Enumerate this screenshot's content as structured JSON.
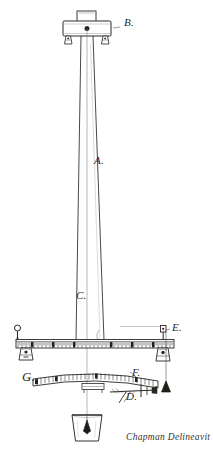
{
  "drawing": {
    "title": "Mast and graduated beam apparatus",
    "medium": "pen and ink line drawing",
    "background_color": "#ffffff",
    "ink_color": "#2a2724",
    "signature": "Chapman Delineavit",
    "labels": [
      {
        "key": "B",
        "text": "B.",
        "refers_to": "top-bracket-block",
        "x": 124,
        "y": 22
      },
      {
        "key": "A",
        "text": "A.",
        "refers_to": "tapered-mast",
        "x": 94,
        "y": 160
      },
      {
        "key": "C",
        "text": "C.",
        "refers_to": "mast-lower-section",
        "x": 76,
        "y": 295
      },
      {
        "key": "E",
        "text": "E.",
        "refers_to": "pulley-and-weight",
        "x": 172,
        "y": 327
      },
      {
        "key": "F",
        "text": "F.",
        "refers_to": "curved-scale-arm",
        "x": 132,
        "y": 372
      },
      {
        "key": "G",
        "text": "G.",
        "refers_to": "curved-arm-left-end",
        "x": 22,
        "y": 375
      },
      {
        "key": "D",
        "text": "D.",
        "refers_to": "clamp-and-cross-screw",
        "x": 128,
        "y": 393
      }
    ],
    "parts": [
      {
        "name": "top-bracket-block",
        "label": "B",
        "description": "rectangular cap block with raised centre boss, pivot point and two small feet"
      },
      {
        "name": "tapered-mast",
        "label": "A",
        "description": "long tapered vertical mast narrowing toward the top"
      },
      {
        "name": "plumb-line",
        "label": "",
        "description": "fine vertical thread dropped from the pivot at B to the vessel below"
      },
      {
        "name": "graduated-beam",
        "label": "",
        "description": "horizontal ruler graduated with fine tick marks across its full length"
      },
      {
        "name": "beam-left-fitting",
        "label": "",
        "description": "ring eye and bracket clamp at left end of the graduated beam"
      },
      {
        "name": "beam-right-fitting",
        "label": "E",
        "description": "bracket clamp, pulley and suspended weight at right end"
      },
      {
        "name": "hanging-weight",
        "label": "",
        "description": "conical plumb weight hanging on a cord from the right pulley"
      },
      {
        "name": "curved-scale-arm",
        "label": "F",
        "description": "curved graduated arm below the beam, marked G at the left end"
      },
      {
        "name": "clamp-cross-screw",
        "label": "D",
        "description": "cross screw with wing clamp at the right of the curved arm"
      },
      {
        "name": "base-vessel",
        "label": "",
        "description": "open vessel holding a plumb bob at the foot of the plumb line"
      }
    ],
    "graduation_counts": {
      "graduated_beam_ticks": 78,
      "curved_arm_ticks": 30
    }
  }
}
